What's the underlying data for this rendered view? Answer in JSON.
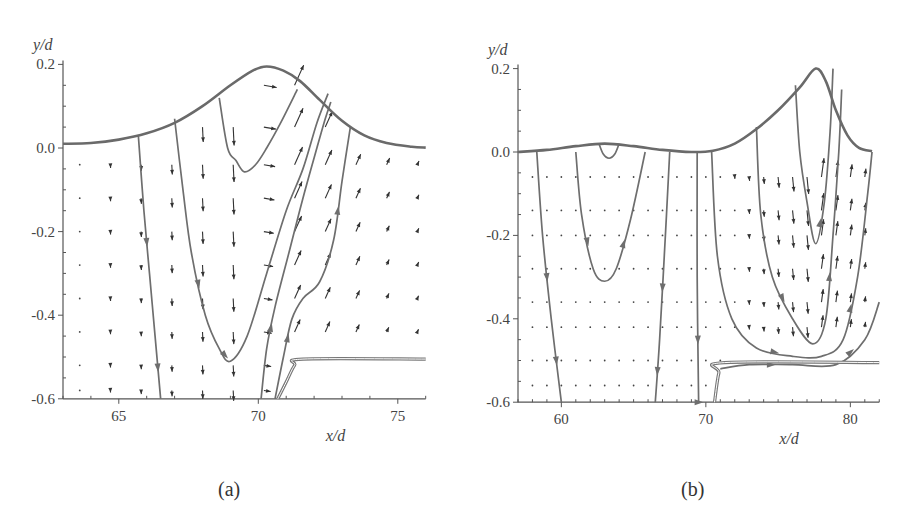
{
  "figure": {
    "caption_a": "(a)",
    "caption_b": "(b)"
  },
  "chart_data": [
    {
      "type": "line",
      "subtype": "velocity-vector-field-with-streamlines",
      "panel": "(a)",
      "title": "",
      "xlabel": "x/d",
      "ylabel": "y/d",
      "xlim": [
        63,
        76
      ],
      "ylim": [
        -0.6,
        0.2
      ],
      "xticks": [
        65,
        70,
        75
      ],
      "xtick_labels": [
        "65",
        "70",
        "75"
      ],
      "yticks": [
        0.2,
        0.0,
        -0.2,
        -0.4,
        -0.6
      ],
      "ytick_labels": [
        "0.2",
        "0.0",
        "-0.2",
        "-0.4",
        "-0.6"
      ],
      "grid": false,
      "legend": null,
      "px": {
        "x0": 63,
        "x_at_min": 63,
        "x_per_unit": 27.9,
        "y_at_zero": 148,
        "y_per_unit": 418
      },
      "free_surface": [
        [
          63,
          0.01
        ],
        [
          64,
          0.012
        ],
        [
          65,
          0.02
        ],
        [
          66,
          0.035
        ],
        [
          67,
          0.06
        ],
        [
          68,
          0.1
        ],
        [
          69,
          0.15
        ],
        [
          69.8,
          0.185
        ],
        [
          70.3,
          0.195
        ],
        [
          70.9,
          0.185
        ],
        [
          71.5,
          0.16
        ],
        [
          72.2,
          0.115
        ],
        [
          73,
          0.065
        ],
        [
          73.8,
          0.03
        ],
        [
          74.6,
          0.012
        ],
        [
          75.5,
          0.003
        ],
        [
          76,
          0.001
        ]
      ],
      "step": [
        [
          70.7,
          -0.6
        ],
        [
          71.0,
          -0.56
        ],
        [
          71.3,
          -0.52
        ],
        [
          71.6,
          -0.505
        ],
        [
          76,
          -0.505
        ]
      ],
      "streamlines": [
        {
          "points": [
            [
              65.7,
              0.03
            ],
            [
              65.9,
              -0.15
            ],
            [
              66.1,
              -0.3
            ],
            [
              66.3,
              -0.45
            ],
            [
              66.5,
              -0.6
            ]
          ],
          "arrows_at": [
            1,
            3
          ],
          "direction": "down"
        },
        {
          "points": [
            [
              67.0,
              0.07
            ],
            [
              67.3,
              -0.1
            ],
            [
              67.6,
              -0.25
            ],
            [
              68.1,
              -0.4
            ],
            [
              68.6,
              -0.48
            ],
            [
              69.0,
              -0.51
            ],
            [
              69.6,
              -0.45
            ],
            [
              70.3,
              -0.3
            ],
            [
              71.0,
              -0.15
            ],
            [
              71.6,
              -0.05
            ],
            [
              72.1,
              0.06
            ],
            [
              72.5,
              0.13
            ]
          ],
          "arrows_at": [
            2,
            4
          ],
          "direction": "down-then-up"
        },
        {
          "points": [
            [
              68.6,
              0.12
            ],
            [
              68.9,
              0.0
            ],
            [
              69.2,
              -0.03
            ],
            [
              69.5,
              -0.057
            ],
            [
              69.9,
              -0.04
            ],
            [
              70.3,
              0.0
            ],
            [
              70.8,
              0.06
            ],
            [
              71.4,
              0.14
            ]
          ],
          "arrows_at": [],
          "direction": "loop"
        },
        {
          "points": [
            [
              70.1,
              -0.6
            ],
            [
              70.3,
              -0.48
            ],
            [
              70.6,
              -0.38
            ],
            [
              71.1,
              -0.25
            ],
            [
              71.6,
              -0.12
            ],
            [
              72.1,
              0.0
            ],
            [
              72.4,
              0.07
            ],
            [
              72.6,
              0.11
            ]
          ],
          "arrows_at": [
            1
          ],
          "direction": "up"
        },
        {
          "points": [
            [
              70.6,
              -0.6
            ],
            [
              70.9,
              -0.5
            ],
            [
              71.2,
              -0.41
            ],
            [
              71.6,
              -0.36
            ],
            [
              72.2,
              -0.32
            ],
            [
              72.7,
              -0.22
            ],
            [
              73.0,
              -0.08
            ],
            [
              73.3,
              0.05
            ]
          ],
          "arrows_at": [
            1,
            5
          ],
          "direction": "up"
        }
      ],
      "vector_grid": {
        "x": [
          63.6,
          64.7,
          65.8,
          66.9,
          68.0,
          69.1,
          70.2,
          71.3,
          72.4,
          73.5,
          74.6,
          75.7
        ],
        "y": [
          0.15,
          0.05,
          -0.04,
          -0.12,
          -0.2,
          -0.28,
          -0.36,
          -0.44,
          -0.52,
          -0.58
        ],
        "description": "downward vectors left of crest (x<69.5), upward-right vectors right of crest (x>70.5), small dots in far field"
      }
    },
    {
      "type": "line",
      "subtype": "velocity-vector-field-with-streamlines",
      "panel": "(b)",
      "title": "",
      "xlabel": "x/d",
      "ylabel": "y/d",
      "xlim": [
        57,
        82
      ],
      "ylim": [
        -0.6,
        0.2
      ],
      "xticks": [
        60,
        70,
        80
      ],
      "xtick_labels": [
        "60",
        "70",
        "80"
      ],
      "yticks": [
        0.2,
        0.0,
        -0.2,
        -0.4,
        -0.6
      ],
      "ytick_labels": [
        "0.2",
        "0.0",
        "-0.2",
        "-0.4",
        "-0.6"
      ],
      "grid": false,
      "legend": null,
      "px": {
        "x_at_min": 518,
        "x_per_unit": 14.45,
        "y_at_zero": 152,
        "y_per_unit": 417
      },
      "free_surface": [
        [
          57,
          0.0
        ],
        [
          59,
          0.005
        ],
        [
          61,
          0.014
        ],
        [
          63,
          0.02
        ],
        [
          65,
          0.014
        ],
        [
          67,
          0.005
        ],
        [
          69,
          0.0
        ],
        [
          70.5,
          0.003
        ],
        [
          72,
          0.02
        ],
        [
          73.5,
          0.055
        ],
        [
          75,
          0.1
        ],
        [
          76.5,
          0.155
        ],
        [
          77.6,
          0.2
        ],
        [
          78.3,
          0.17
        ],
        [
          79.0,
          0.1
        ],
        [
          79.8,
          0.04
        ],
        [
          80.6,
          0.01
        ],
        [
          81.5,
          0.002
        ]
      ],
      "step": [
        [
          70.6,
          -0.6
        ],
        [
          70.9,
          -0.53
        ],
        [
          71.3,
          -0.505
        ],
        [
          82,
          -0.505
        ]
      ],
      "streamlines": [
        {
          "points": [
            [
              58.3,
              0.0
            ],
            [
              58.7,
              -0.2
            ],
            [
              59.3,
              -0.4
            ],
            [
              60.0,
              -0.6
            ]
          ],
          "arrows_at": [
            1,
            2
          ],
          "direction": "up"
        },
        {
          "points": [
            [
              61.0,
              0.0
            ],
            [
              61.4,
              -0.15
            ],
            [
              62.2,
              -0.28
            ],
            [
              63.0,
              -0.31
            ],
            [
              63.8,
              -0.28
            ],
            [
              64.8,
              -0.16
            ],
            [
              65.8,
              0.0
            ]
          ],
          "arrows_at": [
            1,
            4
          ],
          "direction": "loop"
        },
        {
          "points": [
            [
              62.6,
              0.02
            ],
            [
              62.9,
              -0.005
            ],
            [
              63.3,
              -0.015
            ],
            [
              63.7,
              -0.005
            ],
            [
              64.0,
              0.02
            ]
          ],
          "arrows_at": [],
          "direction": "loop"
        },
        {
          "points": [
            [
              67.5,
              0.0
            ],
            [
              67.2,
              -0.2
            ],
            [
              66.8,
              -0.45
            ],
            [
              66.5,
              -0.6
            ]
          ],
          "arrows_at": [
            1,
            2
          ],
          "direction": "down"
        },
        {
          "points": [
            [
              69.4,
              0.0
            ],
            [
              69.4,
              -0.3
            ],
            [
              69.5,
              -0.6
            ]
          ],
          "arrows_at": [
            1,
            2
          ],
          "direction": "down"
        },
        {
          "points": [
            [
              70.4,
              0.0
            ],
            [
              70.8,
              -0.25
            ],
            [
              71.8,
              -0.4
            ],
            [
              73.5,
              -0.47
            ],
            [
              76,
              -0.49
            ],
            [
              78,
              -0.49
            ],
            [
              79.5,
              -0.45
            ],
            [
              80.5,
              -0.3
            ],
            [
              81.2,
              -0.1
            ],
            [
              81.5,
              0.0
            ]
          ],
          "arrows_at": [
            3,
            6
          ],
          "direction": "u-turn"
        },
        {
          "points": [
            [
              73.5,
              0.06
            ],
            [
              73.8,
              -0.15
            ],
            [
              74.6,
              -0.3
            ],
            [
              76.0,
              -0.4
            ],
            [
              77.4,
              -0.46
            ],
            [
              78.3,
              -0.4
            ],
            [
              78.8,
              -0.2
            ],
            [
              79.2,
              0.0
            ],
            [
              79.4,
              0.15
            ]
          ],
          "arrows_at": [
            2,
            5
          ],
          "direction": "u-turn"
        },
        {
          "points": [
            [
              76.2,
              0.16
            ],
            [
              76.5,
              0.0
            ],
            [
              77.0,
              -0.12
            ],
            [
              77.6,
              -0.22
            ],
            [
              78.2,
              -0.12
            ],
            [
              78.6,
              0.05
            ],
            [
              78.8,
              0.2
            ]
          ],
          "arrows_at": [
            3
          ],
          "direction": "u-turn"
        },
        {
          "points": [
            [
              71.0,
              -0.52
            ],
            [
              73,
              -0.51
            ],
            [
              76,
              -0.51
            ],
            [
              79,
              -0.51
            ],
            [
              81,
              -0.45
            ],
            [
              82,
              -0.36
            ]
          ],
          "arrows_at": [
            1,
            3
          ],
          "direction": "right"
        }
      ],
      "vector_grid": {
        "x": [
          58,
          59,
          60,
          61,
          62,
          63,
          64,
          65,
          66,
          67,
          68,
          69,
          70,
          71,
          72,
          73,
          74,
          75,
          76,
          77,
          78,
          79,
          80,
          81
        ],
        "y": [
          -0.06,
          -0.14,
          -0.2,
          -0.28,
          -0.36,
          -0.42,
          -0.5,
          -0.56
        ],
        "description": "tiny dots for x<71, strong downward vectors under crest 71-77, strong upward vectors 78-80"
      }
    }
  ]
}
